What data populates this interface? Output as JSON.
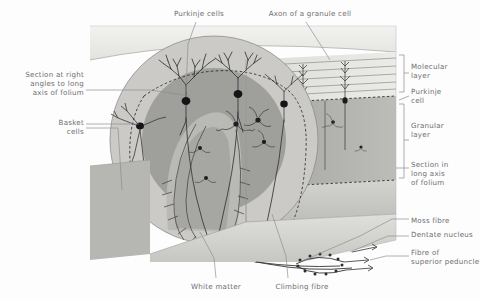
{
  "figure": {
    "palette": {
      "page_background": "#fdfdfd",
      "label_text": "#6e6e72",
      "molecular_layer": "#d8d8d6",
      "granular_layer": "#a9a9a7",
      "white_matter": "#c9c9c6",
      "cut_face_light": "#e6e6e3",
      "cut_face_mid": "#cfcfcb",
      "neuron_ink": "#3b3b3d",
      "soma_fill": "#1c1c1e",
      "leader_line": "#8a8a8e"
    }
  },
  "labels": {
    "top": [
      {
        "id": "purkinje-cells",
        "text": "Purkinje cells",
        "align": "center",
        "x": 156,
        "y": 9,
        "width": 86
      },
      {
        "id": "axon-of-granule-cell",
        "text": "Axon of a granule cell",
        "align": "center",
        "x": 252,
        "y": 9,
        "width": 116
      }
    ],
    "left": [
      {
        "id": "section-right-angles",
        "text": "Section at right\nangles to long\naxis of folium",
        "align": "right",
        "x": 6,
        "y": 70,
        "width": 78
      },
      {
        "id": "basket-cells",
        "text": "Basket\ncells",
        "align": "right",
        "x": 6,
        "y": 118,
        "width": 78
      }
    ],
    "right": [
      {
        "id": "molecular-layer",
        "text": "Molecular\nlayer",
        "align": "left",
        "x": 411,
        "y": 62,
        "width": 68
      },
      {
        "id": "purkinje-cell",
        "text": "Purkinje\ncell",
        "align": "left",
        "x": 411,
        "y": 87,
        "width": 68
      },
      {
        "id": "granular-layer",
        "text": "Granular\nlayer",
        "align": "left",
        "x": 411,
        "y": 121,
        "width": 68
      },
      {
        "id": "section-long-axis",
        "text": "Section in\nlong axis\nof folium",
        "align": "left",
        "x": 411,
        "y": 160,
        "width": 68
      },
      {
        "id": "moss-fibre",
        "text": "Moss fibre",
        "align": "left",
        "x": 411,
        "y": 216,
        "width": 68
      },
      {
        "id": "dentate-nucleus",
        "text": "Dentate nucleus",
        "align": "left",
        "x": 411,
        "y": 234,
        "width": 70
      },
      {
        "id": "fibre-superior-peduncle",
        "text": "Fibre of\nsuperior peduncle",
        "align": "left",
        "x": 411,
        "y": 250,
        "width": 70
      }
    ],
    "bottom": [
      {
        "id": "white-matter",
        "text": "White matter",
        "align": "center",
        "x": 180,
        "y": 282,
        "width": 72
      },
      {
        "id": "climbing-fibre",
        "text": "Climbing fibre",
        "align": "center",
        "x": 262,
        "y": 282,
        "width": 80
      }
    ]
  },
  "structures": {
    "layers": [
      {
        "id": "molecular-layer-band",
        "name": "Molecular layer"
      },
      {
        "id": "purkinje-layer-band",
        "name": "Purkinje cell layer"
      },
      {
        "id": "granular-layer-band",
        "name": "Granular layer"
      },
      {
        "id": "white-matter-core",
        "name": "White matter"
      }
    ],
    "cell_types": [
      {
        "id": "purkinje-cell",
        "name": "Purkinje cell",
        "count_front_face": 3
      },
      {
        "id": "basket-cell",
        "name": "Basket cell",
        "count_front_face": 2
      },
      {
        "id": "granule-cell",
        "name": "Granule cell",
        "count_front_face": 3
      },
      {
        "id": "moss-fibre",
        "name": "Mossy fibre"
      },
      {
        "id": "climbing-fibre",
        "name": "Climbing fibre"
      },
      {
        "id": "dentate-nucleus",
        "name": "Dentate nucleus"
      }
    ]
  }
}
